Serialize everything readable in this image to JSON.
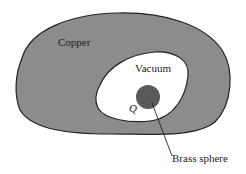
{
  "diagram": {
    "labels": {
      "outer_region": "Copper",
      "cavity": "Vacuum",
      "charge": "Q",
      "sphere": "Brass sphere"
    },
    "colors": {
      "copper_fill": "#8c8c8c",
      "cavity_fill": "#ffffff",
      "sphere_fill": "#5a5a5a",
      "outline": "#222222"
    }
  }
}
